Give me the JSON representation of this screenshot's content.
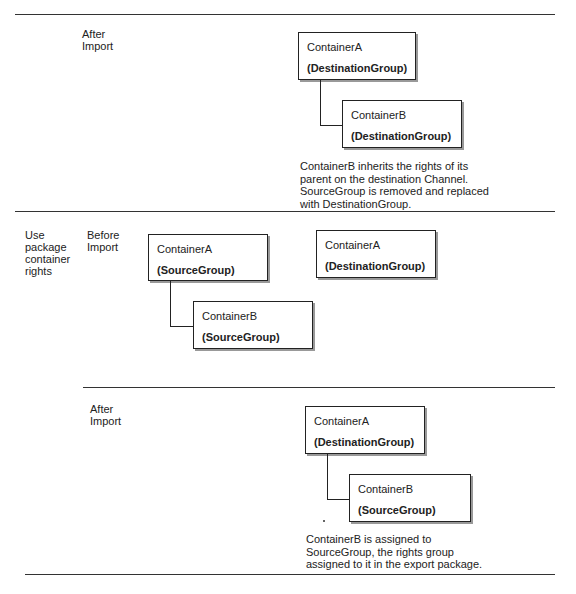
{
  "rows": [
    {
      "option": "",
      "stage": "After Import",
      "diagrams": [
        {
          "containerA": {
            "name": "ContainerA",
            "group": "(DestinationGroup)"
          },
          "containerB": {
            "name": "ContainerB",
            "group": "(DestinationGroup)"
          }
        }
      ],
      "note": "ContainerB inherits the rights of its parent on the destination Channel. SourceGroup is removed and replaced with DestinationGroup."
    },
    {
      "option": "Use package container rights",
      "stage": "Before Import",
      "diagrams": [
        {
          "containerA": {
            "name": "ContainerA",
            "group": "(SourceGroup)"
          },
          "containerB": {
            "name": "ContainerB",
            "group": "(SourceGroup)"
          }
        },
        {
          "containerA": {
            "name": "ContainerA",
            "group": "(DestinationGroup)"
          }
        }
      ]
    },
    {
      "option": "",
      "stage": "After Import",
      "diagrams": [
        {
          "containerA": {
            "name": "ContainerA",
            "group": "(DestinationGroup)"
          },
          "containerB": {
            "name": "ContainerB",
            "group": "(SourceGroup)"
          }
        }
      ],
      "note": "ContainerB is assigned to SourceGroup, the rights group assigned to it in the export package."
    }
  ]
}
